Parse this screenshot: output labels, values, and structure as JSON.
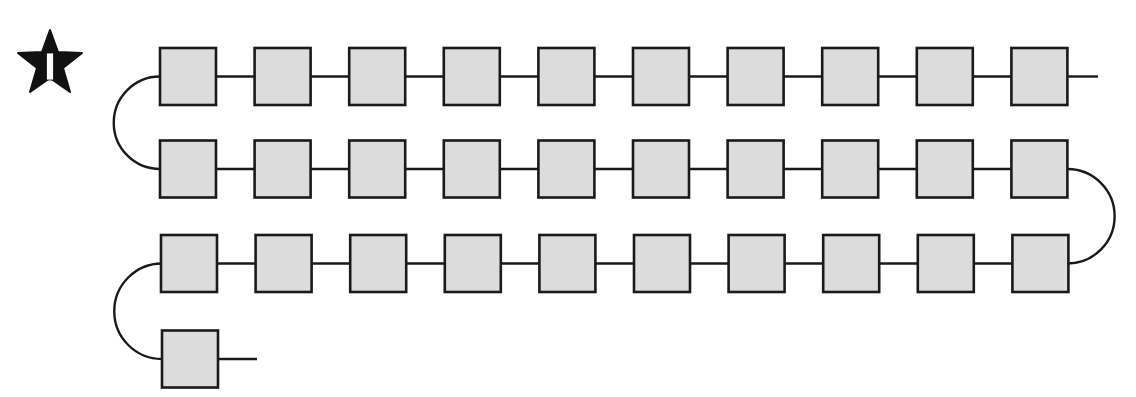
{
  "badge": {
    "shape": "star",
    "number": "1",
    "fill": "#111111",
    "text_color": "#ffffff"
  },
  "diagram": {
    "type": "serpentine-chain",
    "box_fill": "#dcdcdc",
    "stroke": "#1a1a1a",
    "rows": [
      {
        "count": 10,
        "direction": "left-to-right"
      },
      {
        "count": 10,
        "direction": "left-to-right"
      },
      {
        "count": 10,
        "direction": "left-to-right"
      },
      {
        "count": 1,
        "direction": "left-to-right"
      }
    ],
    "total_boxes": 31
  }
}
